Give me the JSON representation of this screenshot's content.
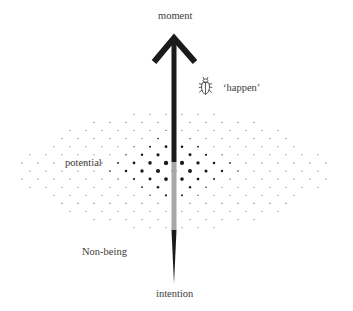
{
  "diagram": {
    "labels": {
      "top": "moment",
      "bottom": "intention",
      "happen": "‘happen’",
      "potential": "potential",
      "non_being": "Non-being"
    },
    "icons": {
      "beetle": "beetle-icon",
      "arrow": "up-arrow"
    },
    "colors": {
      "ink": "#1a1a1a",
      "shaft_gray": "#a8a8a8",
      "text": "#3c3c3c",
      "background": "#ffffff"
    },
    "arrow": {
      "x": 174,
      "tip_y": 34,
      "arm_left": [
        154,
        62
      ],
      "arm_right": [
        195,
        62
      ],
      "black_top": 40,
      "black_bottom": 162,
      "gray_bottom": 230,
      "taper_bottom": 284,
      "shaft_width": 5
    },
    "dot_field": {
      "center_x": 174,
      "center_y": 171,
      "half_width": 158,
      "half_height": 60,
      "row_step": 8.1,
      "col_step": 16,
      "core_x": 172,
      "core_y": 168,
      "core_rx": 80,
      "core_ry": 42,
      "max_radius": 2.6,
      "min_radius": 0.55
    }
  }
}
